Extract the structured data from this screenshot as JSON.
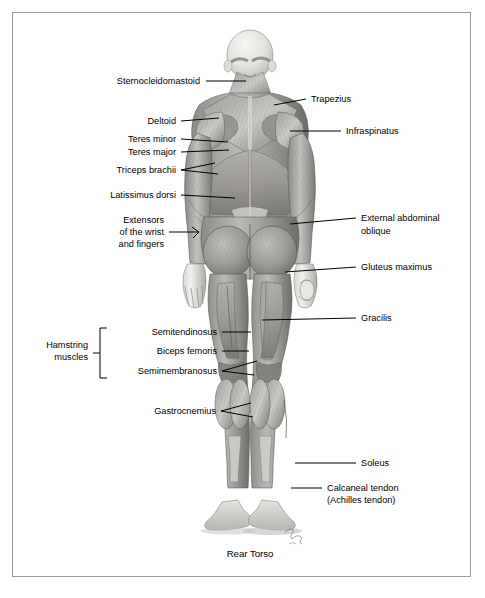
{
  "figure": {
    "caption": "Rear Torso",
    "view": "posterior",
    "signature": "artist-signature",
    "background_color": "#ffffff",
    "border_color": "#9a9a9a",
    "label_color": "#000000"
  },
  "labels_left": [
    {
      "id": "sternocleidomastoid",
      "text": "Sternocleidomastoid",
      "x": 200,
      "y": 84,
      "anchor": "end",
      "leader": "M206,81 L246,81"
    },
    {
      "id": "deltoid",
      "text": "Deltoid",
      "x": 176,
      "y": 124,
      "anchor": "end",
      "leader": "M181,121 L219,118"
    },
    {
      "id": "teres-minor",
      "text": "Teres minor",
      "x": 176,
      "y": 142,
      "anchor": "end",
      "leader": "M181,139 L228,142"
    },
    {
      "id": "teres-major",
      "text": "Teres major",
      "x": 176,
      "y": 155,
      "anchor": "end",
      "leader": "M181,152 L229,150"
    },
    {
      "id": "triceps-brachii",
      "text": "Triceps brachii",
      "x": 176,
      "y": 173,
      "anchor": "end",
      "leader": "M181,170 L215,163 M181,170 L218,174"
    },
    {
      "id": "latissimus-dorsi",
      "text": "Latissimus dorsi",
      "x": 176,
      "y": 198,
      "anchor": "end",
      "leader": "M181,195 L235,198"
    },
    {
      "id": "extensors-wrist-fingers-1",
      "text": "Extensors",
      "x": 164,
      "y": 223,
      "anchor": "end",
      "leader": ""
    },
    {
      "id": "extensors-wrist-fingers-2",
      "text": "of the wrist",
      "x": 164,
      "y": 235,
      "anchor": "end",
      "leader": "M169,232 L199,232 L192,227 M199,232 L193,238"
    },
    {
      "id": "extensors-wrist-fingers-3",
      "text": "and fingers",
      "x": 164,
      "y": 247,
      "anchor": "end",
      "leader": ""
    },
    {
      "id": "semitendinosus",
      "text": "Semitendinosus",
      "x": 217,
      "y": 335,
      "anchor": "end",
      "leader": "M222,332 L251,332"
    },
    {
      "id": "biceps-femoris",
      "text": "Biceps femoris",
      "x": 217,
      "y": 354,
      "anchor": "end",
      "leader": "M222,351 L249,351"
    },
    {
      "id": "semimembranosus",
      "text": "Semimembranosus",
      "x": 217,
      "y": 374,
      "anchor": "end",
      "leader": "M222,371 L257,361 M222,371 L254,375"
    },
    {
      "id": "gastrocnemius",
      "text": "Gastrocnemius",
      "x": 216,
      "y": 414,
      "anchor": "end",
      "leader": "M221,411 L251,403 M221,411 L253,417"
    }
  ],
  "labels_right": [
    {
      "id": "trapezius",
      "text": "Trapezius",
      "x": 311,
      "y": 102,
      "anchor": "start",
      "leader": "M306,99 L274,105"
    },
    {
      "id": "infraspinatus",
      "text": "Infraspinatus",
      "x": 346,
      "y": 134,
      "anchor": "start",
      "leader": "M341,131 L290,131"
    },
    {
      "id": "external-abdominal-oblique-1",
      "text": "External abdominal",
      "x": 361,
      "y": 221,
      "anchor": "start",
      "leader": "M356,218 L290,224"
    },
    {
      "id": "external-abdominal-oblique-2",
      "text": "oblique",
      "x": 361,
      "y": 234,
      "anchor": "start",
      "leader": ""
    },
    {
      "id": "gluteus-maximus",
      "text": "Gluteus maximus",
      "x": 361,
      "y": 270,
      "anchor": "start",
      "leader": "M356,267 L285,272"
    },
    {
      "id": "gracilis",
      "text": "Gracilis",
      "x": 361,
      "y": 321,
      "anchor": "start",
      "leader": "M356,318 L262,320"
    },
    {
      "id": "soleus",
      "text": "Soleus",
      "x": 361,
      "y": 466,
      "anchor": "start",
      "leader": "M356,463 L295,463"
    },
    {
      "id": "calcaneal-tendon-1",
      "text": "Calcaneal tendon",
      "x": 327,
      "y": 491,
      "anchor": "start",
      "leader": "M322,488 L291,488"
    },
    {
      "id": "calcaneal-tendon-2",
      "text": "(Achilles tendon)",
      "x": 327,
      "y": 503,
      "anchor": "start",
      "leader": ""
    }
  ],
  "bracket_group": {
    "id": "hamstring-muscles",
    "line1": "Hamstring",
    "line2": "muscles",
    "label_x": 88,
    "label_y1": 348,
    "label_y2": 360,
    "bracket_path": "M107,328 L100,328 L100,378 L107,378",
    "tick_path": "M100,353 L93,353"
  }
}
